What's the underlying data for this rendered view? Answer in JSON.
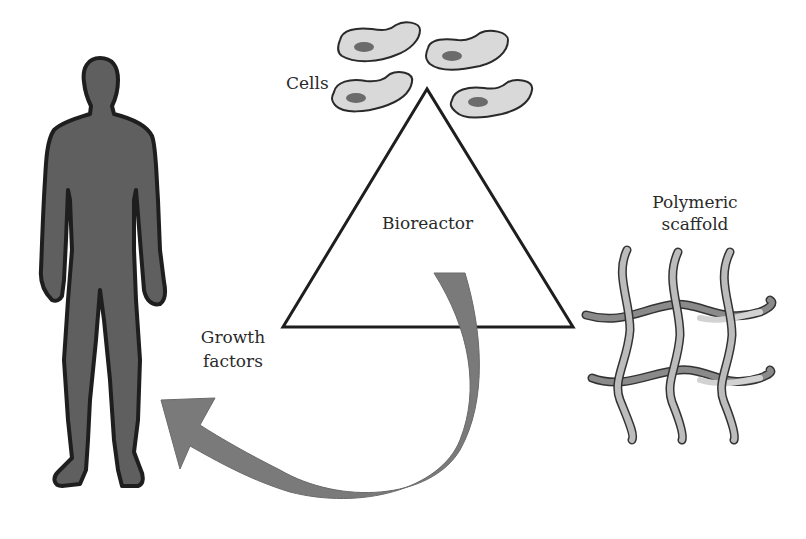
{
  "diagram": {
    "labels": {
      "cells": "Cells",
      "bioreactor": "Bioreactor",
      "scaffold_line1": "Polymeric",
      "scaffold_line2": "scaffold",
      "growth_line1": "Growth",
      "growth_line2": "factors"
    },
    "elements": {
      "human": "human-silhouette-icon",
      "cells": "cell-icon",
      "triangle": "triangle",
      "arrow": "curved-arrow",
      "scaffold": "polymeric-mesh-icon"
    },
    "colors": {
      "body_fill": "#5f5f5f",
      "outline": "#1e1e1e",
      "cell_fill": "#d9d9d9",
      "nucleus": "#6b6b6b",
      "arrow": "#7a7a7a",
      "fiber_dark": "#8a8a8a",
      "fiber_light": "#d2d2d2"
    }
  }
}
